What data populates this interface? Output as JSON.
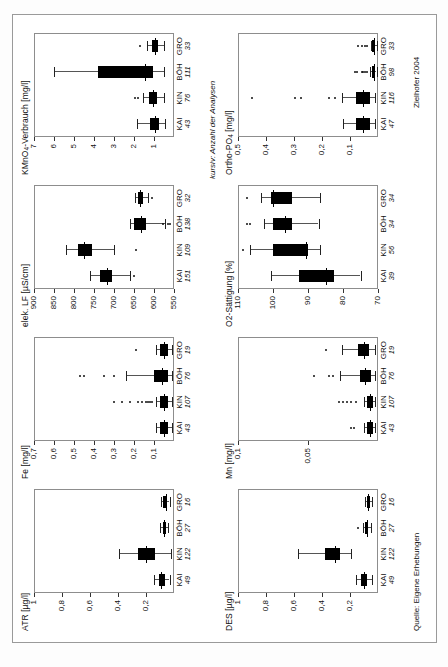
{
  "figure": {
    "source_note": "Quelle: Eigene Erhebungen",
    "italic_note": "kursiv: Anzahl der Analysen",
    "credit": "Zielhofer 2004"
  },
  "sites": [
    {
      "code": "KAI"
    },
    {
      "code": "KIN"
    },
    {
      "code": "BÖH"
    },
    {
      "code": "GRO"
    }
  ],
  "chart_data": [
    {
      "id": "atr",
      "type": "boxplot",
      "title": "ATR [µg/l]",
      "ylabel": "ATR [µg/l]",
      "unit": "µg/l",
      "orientation": "vertical",
      "ylim": [
        0,
        1
      ],
      "yticks": [
        1,
        0.8,
        0.6,
        0.4,
        0.2
      ],
      "yticklabels": [
        "1",
        "0,8",
        "0,6",
        "0,4",
        "0,2"
      ],
      "categories": [
        "KAI",
        "KIN",
        "BÖH",
        "GRO"
      ],
      "counts": [
        49,
        122,
        27,
        16
      ],
      "boxes": [
        {
          "category": "KAI",
          "n": 49,
          "min": 0.03,
          "q1": 0.07,
          "median": 0.09,
          "q3": 0.11,
          "max": 0.14,
          "outliers": []
        },
        {
          "category": "KIN",
          "n": 122,
          "min": 0.02,
          "q1": 0.14,
          "median": 0.2,
          "q3": 0.26,
          "max": 0.39,
          "outliers": []
        },
        {
          "category": "BÖH",
          "n": 27,
          "min": 0.04,
          "q1": 0.06,
          "median": 0.07,
          "q3": 0.08,
          "max": 0.1,
          "outliers": []
        },
        {
          "category": "GRO",
          "n": 16,
          "min": 0.03,
          "q1": 0.05,
          "median": 0.06,
          "q3": 0.08,
          "max": 0.09,
          "outliers": []
        }
      ]
    },
    {
      "id": "fe",
      "type": "boxplot",
      "title": "Fe [mg/l]",
      "ylabel": "Fe [mg/l]",
      "unit": "mg/l",
      "orientation": "vertical",
      "ylim": [
        0,
        0.7
      ],
      "yticks": [
        0.7,
        0.6,
        0.5,
        0.4,
        0.3,
        0.2,
        0.1
      ],
      "yticklabels": [
        "0,7",
        "0,6",
        "0,5",
        "0,4",
        "0,3",
        "0,2",
        "0,1"
      ],
      "categories": [
        "KAI",
        "KIN",
        "BÖH",
        "GRO"
      ],
      "counts": [
        43,
        107,
        76,
        19
      ],
      "boxes": [
        {
          "category": "KAI",
          "n": 43,
          "min": 0.01,
          "q1": 0.03,
          "median": 0.05,
          "q3": 0.07,
          "max": 0.09,
          "outliers": []
        },
        {
          "category": "KIN",
          "n": 107,
          "min": 0.01,
          "q1": 0.03,
          "median": 0.05,
          "q3": 0.07,
          "max": 0.09,
          "outliers": [
            0.11,
            0.12,
            0.13,
            0.14,
            0.16,
            0.18,
            0.22,
            0.26,
            0.3
          ]
        },
        {
          "category": "BÖH",
          "n": 76,
          "min": 0.01,
          "q1": 0.03,
          "median": 0.06,
          "q3": 0.1,
          "max": 0.24,
          "outliers": [
            0.3,
            0.35,
            0.45,
            0.47
          ]
        },
        {
          "category": "GRO",
          "n": 19,
          "min": 0.01,
          "q1": 0.03,
          "median": 0.05,
          "q3": 0.07,
          "max": 0.09,
          "outliers": [
            0.19
          ]
        }
      ]
    },
    {
      "id": "elek_lf",
      "type": "boxplot",
      "title": "elek. LF [µS/cm]",
      "ylabel": "elek. LF [µS/cm]",
      "unit": "µS/cm",
      "orientation": "vertical",
      "ylim": [
        550,
        900
      ],
      "yticks": [
        900,
        850,
        800,
        750,
        700,
        650,
        600,
        550
      ],
      "yticklabels": [
        "900",
        "850",
        "800",
        "750",
        "700",
        "650",
        "600",
        "550"
      ],
      "categories": [
        "KAI",
        "KIN",
        "BÖH",
        "GRO"
      ],
      "counts": [
        151,
        109,
        138,
        32
      ],
      "boxes": [
        {
          "category": "KAI",
          "n": 151,
          "min": 660,
          "q1": 705,
          "median": 718,
          "q3": 735,
          "max": 760,
          "outliers": [
            650
          ]
        },
        {
          "category": "KIN",
          "n": 109,
          "min": 700,
          "q1": 755,
          "median": 775,
          "q3": 790,
          "max": 820,
          "outliers": [
            645
          ]
        },
        {
          "category": "BÖH",
          "n": 138,
          "min": 572,
          "q1": 620,
          "median": 633,
          "q3": 650,
          "max": 660,
          "outliers": [
            560,
            565,
            578
          ]
        },
        {
          "category": "GRO",
          "n": 32,
          "min": 615,
          "q1": 628,
          "median": 634,
          "q3": 640,
          "max": 648,
          "outliers": [
            604
          ]
        }
      ]
    },
    {
      "id": "kmno4",
      "type": "boxplot",
      "title": "KMnO4-Verbrauch [mg/l]",
      "ylabel": "KMnO4-Verbrauch [mg/l]",
      "unit": "mg/l",
      "orientation": "vertical",
      "ylim": [
        0,
        7
      ],
      "yticks": [
        7,
        6,
        5,
        4,
        3,
        2,
        1
      ],
      "yticklabels": [
        "7",
        "6",
        "5",
        "4",
        "3",
        "2",
        "1"
      ],
      "categories": [
        "KAI",
        "KIN",
        "BÖH",
        "GRO"
      ],
      "counts": [
        43,
        76,
        111,
        33
      ],
      "boxes": [
        {
          "category": "KAI",
          "n": 43,
          "min": 0.45,
          "q1": 0.72,
          "median": 0.95,
          "q3": 1.18,
          "max": 1.85,
          "outliers": []
        },
        {
          "category": "KIN",
          "n": 76,
          "min": 0.5,
          "q1": 0.85,
          "median": 1.05,
          "q3": 1.25,
          "max": 1.55,
          "outliers": [
            1.8,
            1.95
          ]
        },
        {
          "category": "BÖH",
          "n": 111,
          "min": 0.5,
          "q1": 1.05,
          "median": 1.45,
          "q3": 3.8,
          "max": 6.0,
          "outliers": []
        },
        {
          "category": "GRO",
          "n": 33,
          "min": 0.5,
          "q1": 0.78,
          "median": 0.95,
          "q3": 1.1,
          "max": 1.35,
          "outliers": [
            1.72
          ]
        }
      ]
    },
    {
      "id": "des",
      "type": "boxplot",
      "title": "DES [µg/l]",
      "ylabel": "DES [µg/l]",
      "unit": "µg/l",
      "orientation": "vertical",
      "ylim": [
        0,
        1
      ],
      "yticks": [
        1,
        0.8,
        0.6,
        0.4,
        0.2
      ],
      "yticklabels": [
        "1",
        "0,8",
        "0,6",
        "0,4",
        "0,2"
      ],
      "categories": [
        "KAI",
        "KIN",
        "BÖH",
        "GRO"
      ],
      "counts": [
        49,
        122,
        27,
        16
      ],
      "boxes": [
        {
          "category": "KAI",
          "n": 49,
          "min": 0.04,
          "q1": 0.08,
          "median": 0.1,
          "q3": 0.12,
          "max": 0.16,
          "outliers": []
        },
        {
          "category": "KIN",
          "n": 122,
          "min": 0.19,
          "q1": 0.27,
          "median": 0.31,
          "q3": 0.38,
          "max": 0.57,
          "outliers": []
        },
        {
          "category": "BÖH",
          "n": 27,
          "min": 0.05,
          "q1": 0.07,
          "median": 0.08,
          "q3": 0.09,
          "max": 0.11,
          "outliers": [
            0.14
          ]
        },
        {
          "category": "GRO",
          "n": 16,
          "min": 0.04,
          "q1": 0.06,
          "median": 0.07,
          "q3": 0.08,
          "max": 0.09,
          "outliers": []
        }
      ]
    },
    {
      "id": "mn",
      "type": "boxplot",
      "title": "Mn [mg/l]",
      "ylabel": "Mn [mg/l]",
      "unit": "mg/l",
      "orientation": "vertical",
      "ylim": [
        0,
        0.1
      ],
      "yticks": [
        0.1,
        0.05
      ],
      "yticklabels": [
        "0,1",
        "0,05"
      ],
      "categories": [
        "KAI",
        "KIN",
        "BÖH",
        "GRO"
      ],
      "counts": [
        43,
        107,
        76,
        19
      ],
      "boxes": [
        {
          "category": "KAI",
          "n": 43,
          "min": 0.002,
          "q1": 0.004,
          "median": 0.006,
          "q3": 0.008,
          "max": 0.01,
          "outliers": [
            0.017,
            0.019
          ]
        },
        {
          "category": "KIN",
          "n": 107,
          "min": 0.002,
          "q1": 0.004,
          "median": 0.006,
          "q3": 0.008,
          "max": 0.01,
          "outliers": [
            0.016,
            0.019,
            0.022,
            0.025,
            0.028
          ]
        },
        {
          "category": "BÖH",
          "n": 76,
          "min": 0.002,
          "q1": 0.005,
          "median": 0.009,
          "q3": 0.013,
          "max": 0.027,
          "outliers": [
            0.032,
            0.035,
            0.046
          ]
        },
        {
          "category": "GRO",
          "n": 19,
          "min": 0.002,
          "q1": 0.006,
          "median": 0.01,
          "q3": 0.014,
          "max": 0.026,
          "outliers": [
            0.037
          ]
        }
      ]
    },
    {
      "id": "o2",
      "type": "boxplot",
      "title": "O2-Sättigung [%]",
      "ylabel": "O2-Sättigung [%]",
      "unit": "%",
      "orientation": "vertical",
      "ylim": [
        70,
        110
      ],
      "yticks": [
        110,
        100,
        90,
        80,
        70
      ],
      "yticklabels": [
        "110",
        "100",
        "90",
        "80",
        "70"
      ],
      "categories": [
        "KAI",
        "KIN",
        "BÖH",
        "GRO"
      ],
      "counts": [
        39,
        56,
        34,
        34
      ],
      "boxes": [
        {
          "category": "KAI",
          "n": 39,
          "min": 75.0,
          "q1": 82.5,
          "median": 85.0,
          "q3": 92.5,
          "max": 100.5,
          "outliers": []
        },
        {
          "category": "KIN",
          "n": 56,
          "min": 86.5,
          "q1": 90.0,
          "median": 90.5,
          "q3": 100.0,
          "max": 106.5,
          "outliers": [
            108.5
          ]
        },
        {
          "category": "BÖH",
          "n": 34,
          "min": 87.0,
          "q1": 94.5,
          "median": 96.5,
          "q3": 100.0,
          "max": 102.5,
          "outliers": [
            106.5,
            107.5
          ]
        },
        {
          "category": "GRO",
          "n": 34,
          "min": 86.5,
          "q1": 94.5,
          "median": 100.0,
          "q3": 100.5,
          "max": 103.5,
          "outliers": [
            107.5
          ]
        }
      ]
    },
    {
      "id": "ortho_po4",
      "type": "boxplot",
      "title": "Ortho-PO4 [mg/l]",
      "ylabel": "Ortho-PO4 [mg/l]",
      "unit": "mg/l",
      "orientation": "vertical",
      "ylim": [
        0,
        0.5
      ],
      "yticks": [
        0.5,
        0.4,
        0.3,
        0.2,
        0.1
      ],
      "yticklabels": [
        "0,5",
        "0,4",
        "0,3",
        "0,2",
        "0,1"
      ],
      "categories": [
        "KAI",
        "KIN",
        "BÖH",
        "GRO"
      ],
      "counts": [
        47,
        116,
        98,
        33
      ],
      "boxes": [
        {
          "category": "KAI",
          "n": 47,
          "min": 0.01,
          "q1": 0.03,
          "median": 0.055,
          "q3": 0.08,
          "max": 0.125,
          "outliers": []
        },
        {
          "category": "KIN",
          "n": 116,
          "min": 0.01,
          "q1": 0.03,
          "median": 0.055,
          "q3": 0.08,
          "max": 0.13,
          "outliers": [
            0.155,
            0.175,
            0.275,
            0.295,
            0.45
          ]
        },
        {
          "category": "BÖH",
          "n": 98,
          "min": 0.005,
          "q1": 0.01,
          "median": 0.015,
          "q3": 0.022,
          "max": 0.028,
          "outliers": [
            0.04,
            0.045,
            0.052,
            0.058,
            0.075,
            0.082
          ]
        },
        {
          "category": "GRO",
          "n": 33,
          "min": 0.005,
          "q1": 0.01,
          "median": 0.014,
          "q3": 0.02,
          "max": 0.026,
          "outliers": [
            0.038,
            0.046,
            0.056,
            0.072
          ]
        }
      ]
    }
  ]
}
